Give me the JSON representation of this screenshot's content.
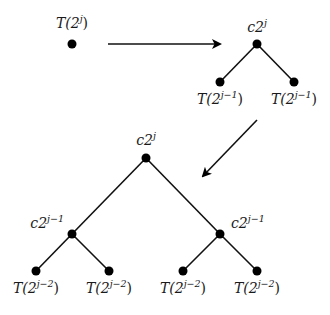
{
  "diagram": {
    "initial": {
      "label": {
        "base": "T(2",
        "exp": "j",
        "close": ")"
      }
    },
    "step1": {
      "root": {
        "label": {
          "base": "c2",
          "exp": "j",
          "close": ""
        }
      },
      "children": [
        {
          "label": {
            "base": "T(2",
            "exp": "j−1",
            "close": ")"
          }
        },
        {
          "label": {
            "base": "T(2",
            "exp": "j−1",
            "close": ")"
          }
        }
      ]
    },
    "step2": {
      "root": {
        "label": {
          "base": "c2",
          "exp": "j",
          "close": ""
        }
      },
      "internal": [
        {
          "label": {
            "base": "c2",
            "exp": "j−1",
            "close": ""
          }
        },
        {
          "label": {
            "base": "c2",
            "exp": "j−1",
            "close": ""
          }
        }
      ],
      "leaves": [
        {
          "label": {
            "base": "T(2",
            "exp": "j−2",
            "close": ")"
          }
        },
        {
          "label": {
            "base": "T(2",
            "exp": "j−2",
            "close": ")"
          }
        },
        {
          "label": {
            "base": "T(2",
            "exp": "j−2",
            "close": ")"
          }
        },
        {
          "label": {
            "base": "T(2",
            "exp": "j−2",
            "close": ")"
          }
        }
      ]
    },
    "arrows": [
      {
        "name": "expand-arrow-right",
        "meaning": "expands to"
      },
      {
        "name": "expand-arrow-down-left",
        "meaning": "expands to"
      }
    ],
    "colors": {
      "ink": "#000000",
      "background": "#ffffff"
    }
  }
}
